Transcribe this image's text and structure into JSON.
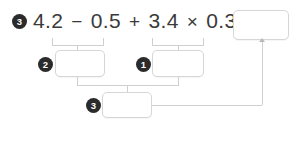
{
  "problem": {
    "number_badge": "3",
    "expression_tokens": [
      {
        "type": "num",
        "text": "4.2"
      },
      {
        "type": "op",
        "text": "−"
      },
      {
        "type": "num",
        "text": "0.5"
      },
      {
        "type": "op",
        "text": "+"
      },
      {
        "type": "num",
        "text": "3.4"
      },
      {
        "type": "op",
        "text": "×"
      },
      {
        "type": "num",
        "text": "0.3"
      },
      {
        "type": "op",
        "text": "="
      }
    ],
    "expression_text": "4.2 − 0.5 + 3.4 × 0.3 ="
  },
  "answer_box": {
    "value": "",
    "placeholder": ""
  },
  "steps": [
    {
      "badge": "2",
      "label": "step-2",
      "value": "",
      "placeholder": "",
      "covers": "4.2 − 0.5"
    },
    {
      "badge": "1",
      "label": "step-1",
      "value": "",
      "placeholder": "",
      "covers": "3.4 × 0.3"
    },
    {
      "badge": "3",
      "label": "step-3",
      "value": "",
      "placeholder": "",
      "covers": "step-2 + step-1"
    }
  ],
  "colors": {
    "badge_fill": "#2b2b2b",
    "badge_text": "#ffffff",
    "text": "#3a3a3a",
    "box_border": "#d6d6d6",
    "connector": "#cfcfcf",
    "background": "#ffffff"
  }
}
